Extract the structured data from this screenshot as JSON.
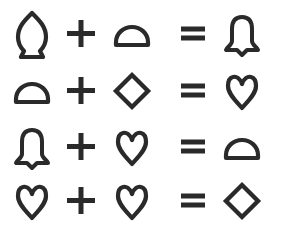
{
  "puzzle": {
    "type": "symbol-equation-puzzle",
    "stroke_color": "#2a2a2a",
    "background": "#ffffff",
    "operators": {
      "plus": "+",
      "equals": "="
    },
    "rows": [
      {
        "a": "acorn",
        "op": "+",
        "b": "semicircle",
        "eq": "=",
        "result": "bell"
      },
      {
        "a": "semicircle",
        "op": "+",
        "b": "diamond",
        "eq": "=",
        "result": "heart"
      },
      {
        "a": "bell",
        "op": "+",
        "b": "heart",
        "eq": "=",
        "result": "semicircle"
      },
      {
        "a": "heart",
        "op": "+",
        "b": "heart",
        "eq": "=",
        "result": "diamond"
      }
    ]
  }
}
